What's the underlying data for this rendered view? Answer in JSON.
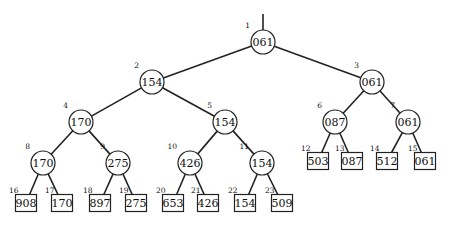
{
  "diagram": {
    "type": "binary-tree",
    "internal_nodes": [
      {
        "index": "1",
        "value": "061",
        "x": 263,
        "y": 42
      },
      {
        "index": "2",
        "value": "154",
        "x": 152,
        "y": 82
      },
      {
        "index": "3",
        "value": "061",
        "x": 372,
        "y": 82
      },
      {
        "index": "4",
        "value": "170",
        "x": 81,
        "y": 122
      },
      {
        "index": "5",
        "value": "154",
        "x": 225,
        "y": 122
      },
      {
        "index": "6",
        "value": "087",
        "x": 335,
        "y": 122
      },
      {
        "index": "7",
        "value": "061",
        "x": 408,
        "y": 122
      },
      {
        "index": "8",
        "value": "170",
        "x": 43,
        "y": 163
      },
      {
        "index": "9",
        "value": "275",
        "x": 118,
        "y": 163
      },
      {
        "index": "10",
        "value": "426",
        "x": 190,
        "y": 163
      },
      {
        "index": "11",
        "value": "154",
        "x": 262,
        "y": 163
      }
    ],
    "leaf_nodes": [
      {
        "index": "12",
        "value": "503",
        "x": 318,
        "y": 161
      },
      {
        "index": "13",
        "value": "087",
        "x": 352,
        "y": 161
      },
      {
        "index": "14",
        "value": "512",
        "x": 387,
        "y": 161
      },
      {
        "index": "15",
        "value": "061",
        "x": 425,
        "y": 161
      },
      {
        "index": "16",
        "value": "908",
        "x": 26,
        "y": 203
      },
      {
        "index": "17",
        "value": "170",
        "x": 62,
        "y": 203
      },
      {
        "index": "18",
        "value": "897",
        "x": 100,
        "y": 203
      },
      {
        "index": "19",
        "value": "275",
        "x": 136,
        "y": 203
      },
      {
        "index": "20",
        "value": "653",
        "x": 173,
        "y": 203
      },
      {
        "index": "21",
        "value": "426",
        "x": 208,
        "y": 203
      },
      {
        "index": "22",
        "value": "154",
        "x": 245,
        "y": 203
      },
      {
        "index": "23",
        "value": "509",
        "x": 282,
        "y": 203
      }
    ]
  }
}
